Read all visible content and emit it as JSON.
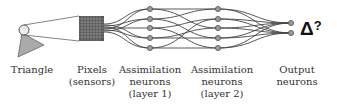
{
  "diagram": {
    "stages": [
      {
        "id": "triangle",
        "lines": [
          "Triangle"
        ],
        "x": 32
      },
      {
        "id": "pixels",
        "lines": [
          "Pixels",
          "(sensors)"
        ],
        "x": 92
      },
      {
        "id": "layer1",
        "lines": [
          "Assimilation",
          "neurons",
          "(layer 1)"
        ],
        "x": 150
      },
      {
        "id": "layer2",
        "lines": [
          "Assimilation",
          "neurons",
          "(layer 2)"
        ],
        "x": 222
      },
      {
        "id": "output",
        "lines": [
          "Output",
          "neurons"
        ],
        "x": 297
      }
    ],
    "output_symbol": "Δ",
    "output_question": "?",
    "layer1_neurons": 5,
    "layer2_neurons": 5,
    "output_neurons": 2
  }
}
